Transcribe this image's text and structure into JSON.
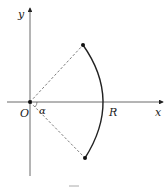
{
  "diagram": {
    "labels": {
      "y_axis": "y",
      "x_axis": "x",
      "origin": "O",
      "angle": "α",
      "radius_point": "R"
    },
    "elements": [
      {
        "type": "axis",
        "name": "x-axis"
      },
      {
        "type": "axis",
        "name": "y-axis"
      },
      {
        "type": "arc",
        "name": "circular-arc",
        "center": "O",
        "radius": "R",
        "half_angle": "α"
      },
      {
        "type": "dashed-segment",
        "from": "O",
        "to": "arc-top-endpoint"
      },
      {
        "type": "dashed-segment",
        "from": "O",
        "to": "arc-bottom-endpoint"
      }
    ],
    "colors": {
      "stroke": "#222222",
      "background": "#ffffff"
    }
  }
}
